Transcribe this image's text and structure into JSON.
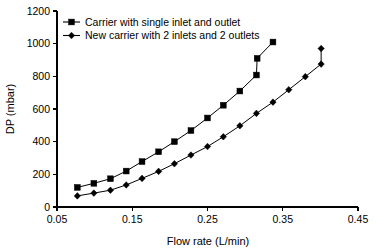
{
  "chart_data": {
    "type": "line",
    "title": "",
    "xlabel": "Flow rate (L/min)",
    "ylabel": "DP (mbar)",
    "xlim": [
      0.05,
      0.45
    ],
    "ylim": [
      0,
      1200
    ],
    "xticks": [
      "0.05",
      "0.15",
      "0.25",
      "0.35",
      "0.45"
    ],
    "xtick_values": [
      0.05,
      0.15,
      0.25,
      0.35,
      0.45
    ],
    "yticks": [
      "0",
      "200",
      "400",
      "600",
      "800",
      "1000",
      "1200"
    ],
    "ytick_values": [
      0,
      200,
      400,
      600,
      800,
      1000,
      1200
    ],
    "grid": false,
    "legend_position": "top-left-inside",
    "series": [
      {
        "name": "Carrier with single inlet and outlet",
        "marker": "square",
        "color": "#000000",
        "x": [
          0.077,
          0.099,
          0.121,
          0.142,
          0.163,
          0.185,
          0.206,
          0.228,
          0.25,
          0.271,
          0.293,
          0.315,
          0.337
        ],
        "y": [
          120,
          145,
          173,
          220,
          278,
          338,
          400,
          468,
          545,
          623,
          710,
          808,
          1010
        ]
      },
      {
        "name": "New carrier with 2 inlets and 2 outlets",
        "marker": "diamond",
        "color": "#000000",
        "x": [
          0.077,
          0.099,
          0.121,
          0.142,
          0.163,
          0.185,
          0.206,
          0.228,
          0.25,
          0.271,
          0.293,
          0.315,
          0.337,
          0.358,
          0.38,
          0.401
        ],
        "y": [
          68,
          85,
          103,
          135,
          175,
          218,
          265,
          318,
          370,
          430,
          497,
          573,
          642,
          718,
          798,
          875
        ]
      }
    ],
    "extra_points": [
      {
        "series": "Carrier with single inlet and outlet",
        "x": 0.316,
        "y": 910
      },
      {
        "series": "New carrier with 2 inlets and 2 outlets",
        "x": 0.401,
        "y": 970
      }
    ],
    "legend": [
      {
        "label": "Carrier with single inlet and outlet",
        "marker": "square"
      },
      {
        "label": "New carrier with 2 inlets and 2 outlets",
        "marker": "diamond"
      }
    ]
  }
}
